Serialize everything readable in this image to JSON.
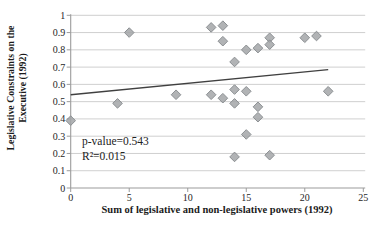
{
  "chart_data": {
    "type": "scatter",
    "title": "",
    "xlabel": "Sum of legislative and non-legislative powers (1992)",
    "ylabel": "Legislative Constraints on the Executive (1992)",
    "ylabel_lines": [
      "Legislative Constraints on the",
      "Executive (1992)"
    ],
    "xlim": [
      0,
      25
    ],
    "ylim": [
      0,
      1
    ],
    "x_ticks": [
      0,
      5,
      10,
      15,
      20,
      25
    ],
    "y_ticks": [
      0,
      0.1,
      0.2,
      0.3,
      0.4,
      0.5,
      0.6,
      0.7,
      0.8,
      0.9,
      1
    ],
    "grid": "horizontal",
    "legend": "none",
    "marker": "diamond",
    "points": [
      [
        0,
        0.39
      ],
      [
        4,
        0.49
      ],
      [
        5,
        0.9
      ],
      [
        9,
        0.54
      ],
      [
        12,
        0.93
      ],
      [
        13,
        0.94
      ],
      [
        13,
        0.85
      ],
      [
        14,
        0.73
      ],
      [
        15,
        0.8
      ],
      [
        16,
        0.81
      ],
      [
        17,
        0.87
      ],
      [
        17,
        0.83
      ],
      [
        20,
        0.87
      ],
      [
        21,
        0.88
      ],
      [
        12,
        0.54
      ],
      [
        13,
        0.52
      ],
      [
        14,
        0.57
      ],
      [
        14,
        0.49
      ],
      [
        15,
        0.56
      ],
      [
        16,
        0.47
      ],
      [
        16,
        0.41
      ],
      [
        22,
        0.56
      ],
      [
        15,
        0.31
      ],
      [
        14,
        0.18
      ],
      [
        17,
        0.19
      ]
    ],
    "trendline": {
      "x": [
        0,
        22
      ],
      "y": [
        0.54,
        0.685
      ]
    },
    "annotation": {
      "lines": [
        "p-value=0.543",
        "R²=0.015"
      ]
    },
    "colors": {
      "marker_fill": "#a3a6a8",
      "marker_stroke": "#8c9093",
      "gridline": "#c9c9c9",
      "axis": "#9c9c9c",
      "trendline": "#404040",
      "text": "#262626"
    }
  }
}
